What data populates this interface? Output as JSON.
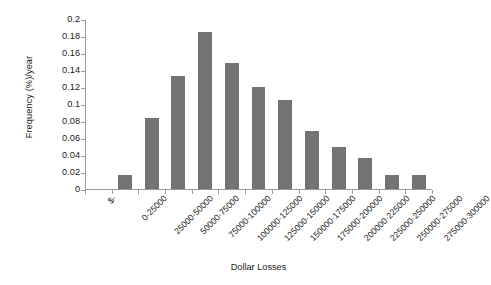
{
  "chart_data": {
    "type": "bar",
    "title": "",
    "xlabel": "Dollar Losses",
    "ylabel": "Frequency (%)/year",
    "categories": [
      "$-",
      "0-25000",
      "25000-50000",
      "50000-75000",
      "75000-100000",
      "100000-125000",
      "125000-150000",
      "150000-175000",
      "175000-200000",
      "200000-225000",
      "225000-250000",
      "250000-275000",
      "275000-300000"
    ],
    "values": [
      null,
      0.016,
      0.083,
      0.133,
      0.185,
      0.148,
      0.12,
      0.105,
      0.068,
      0.05,
      0.036,
      0.017,
      0.017
    ],
    "ylim": [
      0,
      0.2
    ],
    "yticks": [
      0,
      0.02,
      0.04,
      0.06,
      0.08,
      0.1,
      0.12,
      0.14,
      0.16,
      0.18,
      0.2
    ],
    "ytick_labels": [
      "0",
      "0.02",
      "0.04",
      "0.06",
      "0.08",
      "0.1",
      "0.12",
      "0.14",
      "0.16",
      "0.18",
      "0.2"
    ],
    "grid": false,
    "legend": false,
    "bar_color": "#737373",
    "axis_color": "#9a9a9a",
    "background_color": "#ffffff"
  }
}
